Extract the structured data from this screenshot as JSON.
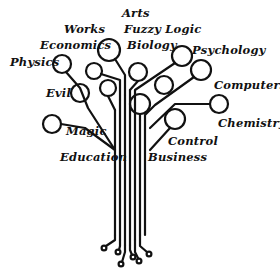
{
  "diagram": {
    "type": "knowledge-tree",
    "line_color": "#111111",
    "background": "#ffffff",
    "labels": {
      "arts": "Arts",
      "works": "Works",
      "fuzzy_logic": "Fuzzy Logic",
      "economics": "Economics",
      "biology": "Biology",
      "psychology": "Psychology",
      "physics": "Physics",
      "computers": "Computers",
      "evil": "Evil",
      "chemistry": "Chemistry",
      "magic": "Magic",
      "control": "Control",
      "education": "Education",
      "business": "Business"
    }
  }
}
